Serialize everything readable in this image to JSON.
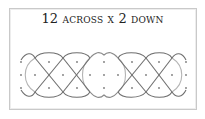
{
  "diagram": {
    "title": "12 across x 2 down",
    "title_parts": {
      "across_count": "12",
      "across_label": "across x",
      "down_count": "2",
      "down_label": "down"
    },
    "grid": {
      "columns": 12,
      "rows": 2,
      "dot_rows_y": [
        62,
        75,
        88
      ],
      "outer_dot_columns_x": [
        21,
        49,
        77,
        104,
        132,
        159,
        186
      ],
      "middle_dot_columns_x": [
        21,
        35,
        63,
        90,
        104,
        118,
        146,
        172,
        186
      ]
    },
    "colors": {
      "border": "#c9c9c9",
      "cord_dark": "#707070",
      "cord_light": "#b0b0b0",
      "dot": "#808080",
      "text": "#222222"
    }
  }
}
